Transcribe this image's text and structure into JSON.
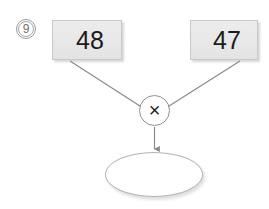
{
  "problem": {
    "number_label": "9",
    "number_icon": "circled-number"
  },
  "operands": [
    {
      "id": "left",
      "value": "48"
    },
    {
      "id": "right",
      "value": "47"
    }
  ],
  "operator": {
    "symbol": "×",
    "icon": "multiply-icon",
    "name": "multiplication"
  },
  "answer": {
    "value": "",
    "placeholder": ""
  },
  "connectors": [
    {
      "id": "left-to-operator",
      "from": "operand-box-left",
      "to": "operator-node",
      "arrow": false
    },
    {
      "id": "right-to-operator",
      "from": "operand-box-right",
      "to": "operator-node",
      "arrow": false
    },
    {
      "id": "operator-to-answer",
      "from": "operator-node",
      "to": "answer-ellipse",
      "arrow": true
    }
  ],
  "colors": {
    "box_fill": "#e8e8e9",
    "box_border": "#c9c9c9",
    "line": "#8a8a8a",
    "text": "#1b1b1b",
    "number_label": "#6f6f6f",
    "background": "#ffffff"
  }
}
